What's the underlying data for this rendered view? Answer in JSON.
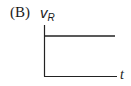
{
  "diagram": {
    "panel_label": "(B)",
    "y_axis": {
      "symbol": "v",
      "subscript": "R"
    },
    "x_axis": {
      "symbol": "t"
    },
    "signal": {
      "shape": "constant",
      "description": "horizontal line at constant positive level"
    },
    "line_color": "#222222"
  }
}
